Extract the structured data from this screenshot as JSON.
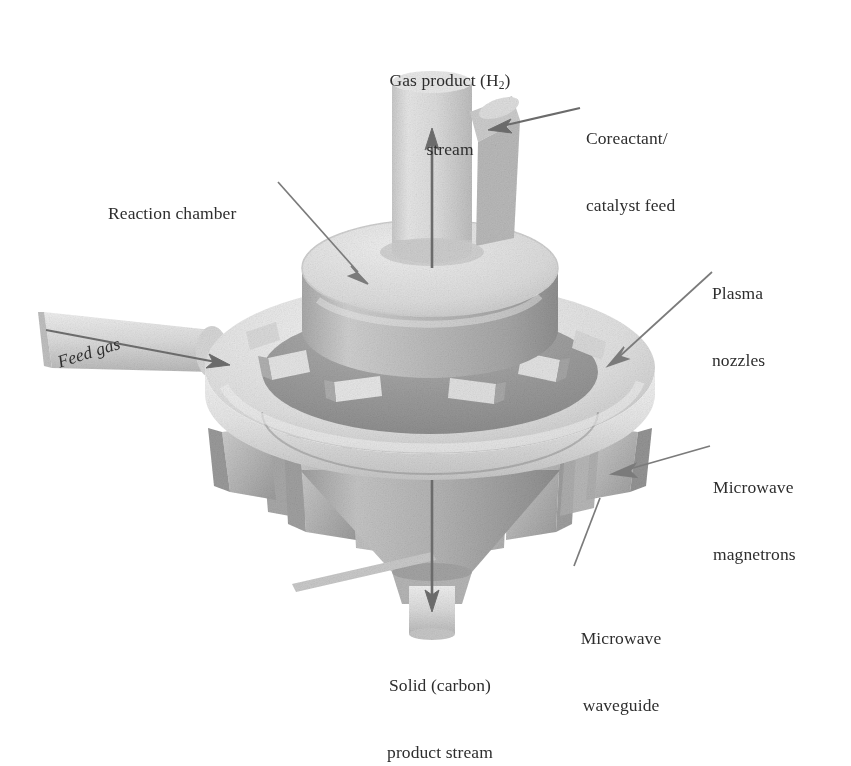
{
  "figure": {
    "type": "3d-cutaway-diagram",
    "background_color": "#ffffff",
    "line_color": "#6f6f6f",
    "text_color": "#2e2e2e"
  },
  "labels": {
    "gas_product": {
      "line1": "Gas product (H",
      "sub": "2",
      "line1_end": ")",
      "line2": "stream"
    },
    "coreactant": {
      "line1": "Coreactant/",
      "line2": "catalyst feed"
    },
    "reaction_chamber": {
      "line1": "Reaction chamber"
    },
    "feed_gas": {
      "line1": "Feed gas"
    },
    "plasma_nozzles": {
      "line1": "Plasma",
      "line2": "nozzles"
    },
    "microwave_magnetrons": {
      "line1": "Microwave",
      "line2": "magnetrons"
    },
    "microwave_waveguide": {
      "line1": "Microwave",
      "line2": "waveguide"
    },
    "solid_product": {
      "line1": "Solid (carbon)",
      "line2": "product stream"
    }
  },
  "components": {
    "outlet_tube_top": "gas-product-riser",
    "side_branch": "coreactant-catalyst-inlet",
    "chamber_cylinder": "reaction-chamber",
    "feed_ring": "feed-gas-torus-manifold",
    "feed_pipe": "feed-gas-inlet-pipe",
    "nozzle_blocks": "plasma-nozzles",
    "waveguide_blocks": "microwave-waveguides",
    "magnetron_blocks": "microwave-magnetrons",
    "cone": "collection-cone",
    "outlet_tube_bottom": "solid-product-outlet"
  },
  "flow_arrows": {
    "gas_product_up": "upward",
    "coreactant_in": "leftward-into-branch",
    "feed_gas_in": "rightward-into-ring",
    "solid_product_down": "downward"
  },
  "palette": {
    "light": "#ececec",
    "mid": "#d2d2d2",
    "mid_dark": "#b4b4b4",
    "dark": "#9a9a9a",
    "darker": "#8a8a8a",
    "shadow": "#7d7d7d",
    "arrow": "#6b6b6b"
  }
}
